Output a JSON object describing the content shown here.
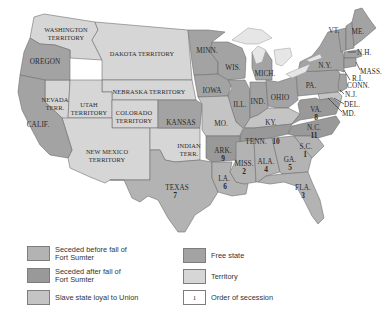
{
  "colors": {
    "seceded_before": "#b3b3b3",
    "seceded_after": "#999999",
    "slave_loyal": "#c4c4c4",
    "free_state": "#a3a3a3",
    "territory": "#d6d6d6",
    "lakes": "#e6e6e6",
    "border": "#6f6f6f"
  },
  "map": {
    "territories": {
      "washington": [
        "WASHINGTON",
        "TERRITORY"
      ],
      "dakota": "DAKOTA TERRITORY",
      "nebraska": "NEBRASKA TERRITORY",
      "nevada": [
        "NEVADA",
        "TERR."
      ],
      "utah": [
        "UTAH",
        "TERRITORY"
      ],
      "colorado": [
        "COLORADO",
        "TERRITORY"
      ],
      "new_mexico": [
        "NEW MEXICO",
        "TERRITORY"
      ],
      "indian": [
        "INDIAN",
        "TERR."
      ]
    },
    "free_states": {
      "oregon": "OREGON",
      "california": "CALIF.",
      "minnesota": "MINN.",
      "wisconsin": "WIS.",
      "iowa": "IOWA",
      "michigan": "MICH.",
      "kansas": "KANSAS",
      "illinois": "ILL.",
      "indiana": "IND.",
      "ohio": "OHIO",
      "pennsylvania": "PA.",
      "new_york": "N.Y.",
      "vermont": "VT.",
      "maine": "ME.",
      "new_hampshire": "N.H.",
      "massachusetts": "MASS.",
      "rhode_island": "R.I.",
      "connecticut": "CONN.",
      "new_jersey": "N.J."
    },
    "slave_loyal_states": {
      "missouri": "MO.",
      "kentucky": "KY.",
      "delaware": "DEL.",
      "maryland": "MD."
    },
    "seceded_states": [
      {
        "key": "south_carolina",
        "label": "S.C.",
        "order": "1",
        "group": "before"
      },
      {
        "key": "mississippi",
        "label": "MISS.",
        "order": "2",
        "group": "before"
      },
      {
        "key": "florida",
        "label": "FLA.",
        "order": "3",
        "group": "before"
      },
      {
        "key": "alabama",
        "label": "ALA.",
        "order": "4",
        "group": "before"
      },
      {
        "key": "georgia",
        "label": "GA.",
        "order": "5",
        "group": "before"
      },
      {
        "key": "louisiana",
        "label": "LA.",
        "order": "6",
        "group": "before"
      },
      {
        "key": "texas",
        "label": "TEXAS",
        "order": "7",
        "group": "before"
      },
      {
        "key": "virginia",
        "label": "VA.",
        "order": "8",
        "group": "after"
      },
      {
        "key": "arkansas",
        "label": "ARK.",
        "order": "9",
        "group": "after"
      },
      {
        "key": "tennessee",
        "label": "TENN.",
        "order": "10",
        "group": "after"
      },
      {
        "key": "north_carolina",
        "label": "N.C.",
        "order": "11",
        "group": "after"
      }
    ]
  },
  "legend": {
    "items": [
      {
        "label": "Seceded before fall of Fort Sumter",
        "line1": "Seceded before fall of",
        "line2": "Fort Sumter"
      },
      {
        "label": "Seceded after fall of Fort Sumter",
        "line1": "Seceded after fall of",
        "line2": "Fort Sumter"
      },
      {
        "label": "Slave state loyal to Union"
      },
      {
        "label": "Free state"
      },
      {
        "label": "Territory"
      },
      {
        "label": "Order of secession",
        "swatch_text": "1"
      }
    ]
  }
}
